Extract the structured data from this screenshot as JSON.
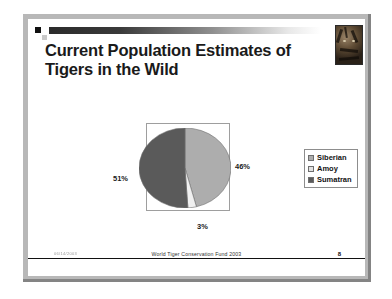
{
  "slide": {
    "title_line1": "Current Population Estimates of",
    "title_line2": "Tigers in the Wild",
    "decoration_icon": "square-bullet",
    "photo_icon": "tiger-photo",
    "footer": {
      "date": "06/14/2003",
      "center": "World Tiger Conservation Fund 2003",
      "page_number": "8"
    }
  },
  "chart_data": {
    "type": "pie",
    "title": "",
    "categories": [
      "Siberian",
      "Amoy",
      "Sumatran"
    ],
    "values": [
      46,
      3,
      51
    ],
    "labels": [
      "46%",
      "3%",
      "51%"
    ],
    "colors": [
      "#adadad",
      "#f0f0f0",
      "#5a5a5a"
    ],
    "legend_position": "right",
    "grid": false,
    "unit": "percent"
  },
  "legend": {
    "items": [
      {
        "label": "Siberian",
        "color": "#adadad"
      },
      {
        "label": "Amoy",
        "color": "#e2e2e2"
      },
      {
        "label": "Sumatran",
        "color": "#5a5a5a"
      }
    ]
  }
}
